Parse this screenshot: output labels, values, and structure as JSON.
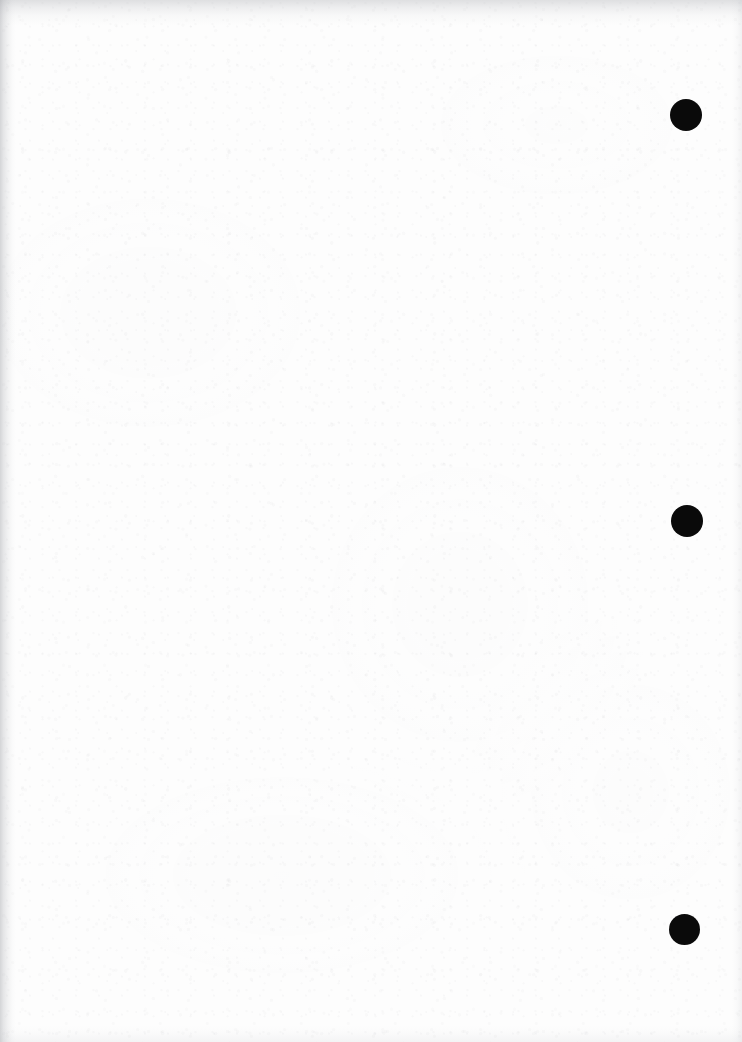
{
  "document": {
    "kind": "scanned-blank-page",
    "title": "Blank scanned page",
    "page_width": 742,
    "page_height": 1042,
    "background_color": "#fdfdfd",
    "body_text": "",
    "note": "No printed text or figures are visible on this page."
  },
  "marks": {
    "label": "Binding hole marks",
    "color": "#0a0a0a",
    "count": 3,
    "items": [
      {
        "name": "hole-mark-top",
        "cx": 686,
        "cy": 115,
        "diameter": 32
      },
      {
        "name": "hole-mark-middle",
        "cx": 687,
        "cy": 521,
        "diameter": 32
      },
      {
        "name": "hole-mark-bottom",
        "cx": 684,
        "cy": 929,
        "diameter": 31
      }
    ]
  },
  "scan_artifacts": {
    "left_edge_shadow": true,
    "top_edge_shadow": true,
    "right_edge_shadow": true,
    "bottom_edge_shadow": true,
    "paper_grain": true,
    "grain_tint": "#a8aab0"
  }
}
